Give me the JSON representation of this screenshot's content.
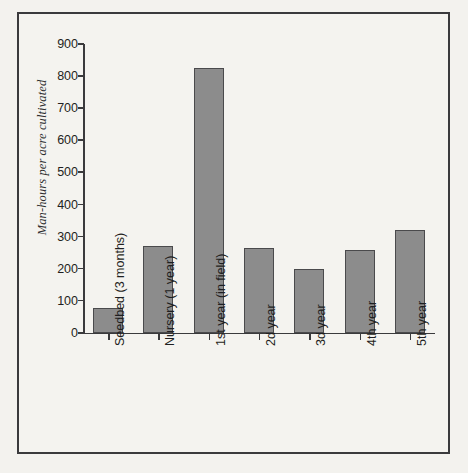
{
  "chart_data": {
    "type": "bar",
    "title": "",
    "subtitle": "",
    "xlabel": "",
    "ylabel": "Man-hours per acre cultivated",
    "ylim": [
      0,
      900
    ],
    "ytick_step": 100,
    "yticks": [
      900,
      800,
      700,
      600,
      500,
      400,
      300,
      200,
      100,
      0
    ],
    "ytick_labels": [
      "900",
      "800",
      "700",
      "600",
      "500",
      "400",
      "300",
      "200",
      "100",
      "0"
    ],
    "categories": [
      "Seedbed (3 months)",
      "Nursery (1 year)",
      "1st year (in field)",
      "2d year",
      "3d year",
      "4th year",
      "5th year"
    ],
    "values": [
      78,
      272,
      825,
      265,
      200,
      258,
      320
    ],
    "grid": false,
    "legend": null,
    "legend_position": "none",
    "bar_color": "#8c8c8c",
    "bar_edge_color": "#4a4a4c",
    "axis_color": "#3a3a3c",
    "background_color": "#f4f3ef",
    "frame_color": "#3a3a3c",
    "annotations": []
  }
}
